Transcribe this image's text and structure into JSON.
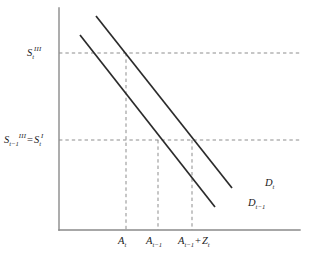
{
  "figure": {
    "type": "economic-supply-demand-diagram",
    "axes": {
      "y_axis_name": "price-axis",
      "x_axis_name": "quantity-axis",
      "x_range_px": [
        59,
        300
      ],
      "y_range_px": [
        8,
        230
      ],
      "grid": false
    },
    "y_tick_labels": [
      {
        "id": "s-t-III",
        "base": "S",
        "sub": "t",
        "sup": "III",
        "plain": "S_t^III",
        "y_px": 53
      },
      {
        "id": "s-t-minus-1-III-equals-s-t-I",
        "base_1": "S",
        "sub_1": "t−1",
        "sup_1": "III",
        "operator": "=",
        "base_2": "S",
        "sub_2": "t",
        "sup_2": "I",
        "plain": "S_{t-1}^{III} = S_t^{I}",
        "y_px": 140
      }
    ],
    "x_tick_labels": [
      {
        "id": "a-t",
        "base": "A",
        "sub": "t",
        "plain": "A_t",
        "x_px": 126
      },
      {
        "id": "a-t-minus-1",
        "base": "A",
        "sub": "t−1",
        "plain": "A_{t-1}",
        "x_px": 158
      },
      {
        "id": "a-t-minus-1-plus-z-t",
        "base_1": "A",
        "sub_1": "t−1",
        "operator": "+",
        "base_2": "Z",
        "sub_2": "t",
        "plain": "A_{t-1} + Z_t",
        "x_px": 192
      }
    ],
    "curves": [
      {
        "id": "demand-t",
        "label_base": "D",
        "label_sub": "t",
        "plain": "D_t",
        "x1": 96,
        "y1": 16,
        "x2": 232,
        "y2": 188,
        "position": "right"
      },
      {
        "id": "demand-t-minus-1",
        "label_base": "D",
        "label_sub": "t−1",
        "plain": "D_{t-1}",
        "x1": 80,
        "y1": 35,
        "x2": 215,
        "y2": 207,
        "position": "left"
      }
    ],
    "guides": {
      "horizontal_y_px": [
        53,
        140
      ],
      "vertical_x_px": [
        126,
        158,
        192
      ]
    },
    "colors": {
      "axis": "#8a8a8a",
      "curve": "#2b2b2b",
      "guide": "#8d8d8d",
      "text": "#1a1a1a",
      "background": "#ffffff"
    }
  }
}
